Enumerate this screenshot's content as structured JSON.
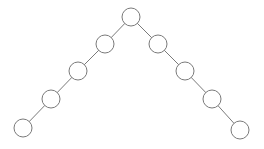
{
  "diagram": {
    "type": "tree",
    "node_radius": 9,
    "colors": {
      "stroke": "#7a7a7a",
      "fill": "#ffffff",
      "background": "#ffffff"
    },
    "nodes": [
      {
        "id": "root",
        "x": 131,
        "y": 17
      },
      {
        "id": "l1",
        "x": 105,
        "y": 44
      },
      {
        "id": "l2",
        "x": 78,
        "y": 71
      },
      {
        "id": "l3",
        "x": 51,
        "y": 99
      },
      {
        "id": "l4",
        "x": 23,
        "y": 128
      },
      {
        "id": "r1",
        "x": 158,
        "y": 44
      },
      {
        "id": "r2",
        "x": 185,
        "y": 71
      },
      {
        "id": "r3",
        "x": 212,
        "y": 99
      },
      {
        "id": "r4",
        "x": 240,
        "y": 130
      }
    ],
    "edges": [
      [
        "root",
        "l1"
      ],
      [
        "l1",
        "l2"
      ],
      [
        "l2",
        "l3"
      ],
      [
        "l3",
        "l4"
      ],
      [
        "root",
        "r1"
      ],
      [
        "r1",
        "r2"
      ],
      [
        "r2",
        "r3"
      ],
      [
        "r3",
        "r4"
      ]
    ]
  }
}
